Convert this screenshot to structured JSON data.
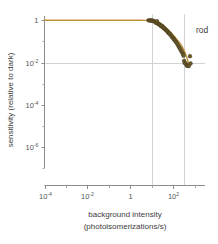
{
  "chart_data": {
    "type": "scatter",
    "title": "",
    "xlabel_line1": "background intensity",
    "xlabel_line2": "(photoisomerizations/s)",
    "ylabel": "sensitivity (relative to dark)",
    "xscale": "log",
    "yscale": "log",
    "xlim": [
      0.0001,
      3000
    ],
    "ylim": [
      1e-07,
      1.6
    ],
    "grid": true,
    "legend_position": "none",
    "annotations": [
      {
        "name": "rod",
        "text": "rod",
        "x": 900,
        "y": 0.33
      }
    ],
    "xticks": [
      {
        "value": 0.0001,
        "mantissa": "10",
        "exponent": "-4"
      },
      {
        "value": 0.01,
        "mantissa": "10",
        "exponent": "-2"
      },
      {
        "value": 1,
        "mantissa": "1",
        "exponent": ""
      },
      {
        "value": 100,
        "mantissa": "10",
        "exponent": "2"
      }
    ],
    "yticks": [
      {
        "value": 1,
        "mantissa": "1",
        "exponent": ""
      },
      {
        "value": 0.01,
        "mantissa": "10",
        "exponent": "-2"
      },
      {
        "value": 0.0001,
        "mantissa": "10",
        "exponent": "-4"
      },
      {
        "value": 1e-06,
        "mantissa": "10",
        "exponent": "-6"
      }
    ],
    "xminorticks": [
      0.001,
      0.1,
      10,
      1000
    ],
    "yminorticks": [
      0.1,
      0.001,
      1e-05,
      1e-07
    ],
    "gridlines_vertical": [
      10,
      300
    ],
    "gridlines_horizontal": [
      0.01
    ],
    "series": [
      {
        "name": "rod",
        "marker": "circle",
        "marker_color": "#6b5a2a",
        "points": [
          [
            7.0,
            1.0
          ],
          [
            8.2,
            0.99
          ],
          [
            9.0,
            0.97
          ],
          [
            10.0,
            1.0
          ],
          [
            10.5,
            0.95
          ],
          [
            12.0,
            0.92
          ],
          [
            13.5,
            0.88
          ],
          [
            15.0,
            0.8
          ],
          [
            16.0,
            0.75
          ],
          [
            17.5,
            0.9
          ],
          [
            19.0,
            0.7
          ],
          [
            21.0,
            0.66
          ],
          [
            23.0,
            0.62
          ],
          [
            25.0,
            0.6
          ],
          [
            27.0,
            0.52
          ],
          [
            30.0,
            0.55
          ],
          [
            33.0,
            0.47
          ],
          [
            36.0,
            0.42
          ],
          [
            40.0,
            0.4
          ],
          [
            44.0,
            0.36
          ],
          [
            48.0,
            0.33
          ],
          [
            53.0,
            0.3
          ],
          [
            58.0,
            0.26
          ],
          [
            64.0,
            0.24
          ],
          [
            70.0,
            0.22
          ],
          [
            78.0,
            0.19
          ],
          [
            86.0,
            0.165
          ],
          [
            95.0,
            0.15
          ],
          [
            105.0,
            0.13
          ],
          [
            115.0,
            0.115
          ],
          [
            128.0,
            0.1
          ],
          [
            140.0,
            0.088
          ],
          [
            155.0,
            0.075
          ],
          [
            172.0,
            0.062
          ],
          [
            190.0,
            0.052
          ],
          [
            210.0,
            0.044
          ],
          [
            232.0,
            0.036
          ],
          [
            258.0,
            0.03
          ],
          [
            285.0,
            0.025
          ],
          [
            300.0,
            0.021
          ],
          [
            320.0,
            0.012
          ],
          [
            340.0,
            0.0095
          ],
          [
            380.0,
            0.009
          ],
          [
            420.0,
            0.0072
          ],
          [
            470.0,
            0.007
          ],
          [
            530.0,
            0.0068
          ],
          [
            600.0,
            0.02
          ],
          [
            640.0,
            0.009
          ]
        ]
      }
    ],
    "fit_curve": {
      "name": "weber-fit",
      "color": "#c0903a",
      "description": "flat at 1 then power-law rolloff",
      "points": [
        [
          0.0001,
          1.0
        ],
        [
          0.001,
          1.0
        ],
        [
          0.01,
          1.0
        ],
        [
          0.1,
          1.0
        ],
        [
          1.0,
          1.0
        ],
        [
          3.0,
          0.999
        ],
        [
          5.0,
          0.998
        ],
        [
          7.0,
          0.995
        ],
        [
          10.0,
          0.985
        ],
        [
          13.0,
          0.95
        ],
        [
          16.0,
          0.9
        ],
        [
          20.0,
          0.82
        ],
        [
          25.0,
          0.72
        ],
        [
          32.0,
          0.6
        ],
        [
          40.0,
          0.5
        ],
        [
          50.0,
          0.41
        ],
        [
          63.0,
          0.33
        ],
        [
          80.0,
          0.255
        ],
        [
          100.0,
          0.198
        ],
        [
          125.0,
          0.152
        ],
        [
          160.0,
          0.112
        ],
        [
          200.0,
          0.085
        ],
        [
          250.0,
          0.06
        ],
        [
          300.0,
          0.042
        ],
        [
          360.0,
          0.028
        ],
        [
          420.0,
          0.018
        ],
        [
          480.0,
          0.0115
        ],
        [
          540.0,
          0.0085
        ],
        [
          600.0,
          0.0072
        ]
      ]
    }
  }
}
